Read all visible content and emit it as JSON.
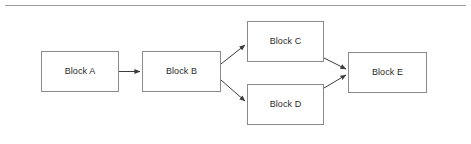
{
  "canvas": {
    "width": 471,
    "height": 144,
    "background": "#ffffff",
    "line_color": "#3d3d3d",
    "box_border_color": "#8a8a8a",
    "text_color": "#2b2b2b",
    "rule_color": "#9a9a9a"
  },
  "diagram": {
    "type": "block-flow-diagram",
    "nodes": [
      {
        "id": "a",
        "label": "Block A"
      },
      {
        "id": "b",
        "label": "Block B"
      },
      {
        "id": "c",
        "label": "Block C"
      },
      {
        "id": "d",
        "label": "Block D"
      },
      {
        "id": "e",
        "label": "Block E"
      }
    ],
    "edges": [
      {
        "from": "a",
        "to": "b",
        "style": "straight",
        "arrow": true
      },
      {
        "from": "b",
        "to": "c",
        "style": "diagonal-up",
        "arrow": true
      },
      {
        "from": "b",
        "to": "d",
        "style": "diagonal-down",
        "arrow": true
      },
      {
        "from": "c",
        "to": "e",
        "style": "diagonal-down",
        "arrow": true
      },
      {
        "from": "d",
        "to": "e",
        "style": "diagonal-up",
        "arrow": true
      }
    ]
  }
}
